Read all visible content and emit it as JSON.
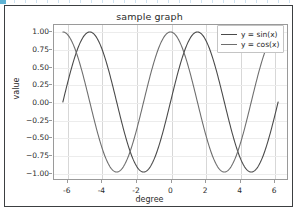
{
  "figure": {
    "background": "#ffffff",
    "border_color": "#3c3f41"
  },
  "chart_data": {
    "type": "line",
    "title": "sample graph",
    "xlabel": "degree",
    "ylabel": "value",
    "xlim": [
      -6.8,
      6.8
    ],
    "ylim": [
      -1.1,
      1.1
    ],
    "xticks": [
      "-6",
      "-4",
      "-2",
      "0",
      "2",
      "4",
      "6"
    ],
    "xtick_values": [
      -6,
      -4,
      -2,
      0,
      2,
      4,
      6
    ],
    "yticks": [
      "1.00",
      "0.75",
      "0.50",
      "0.25",
      "0.00",
      "−0.25",
      "−0.50",
      "−0.75",
      "−1.00"
    ],
    "ytick_values": [
      1.0,
      0.75,
      0.5,
      0.25,
      0.0,
      -0.25,
      -0.5,
      -0.75,
      -1.0
    ],
    "grid": true,
    "legend_position": "upper right",
    "series": [
      {
        "name": "y = sin(x)",
        "color": "#4a4a4a",
        "x": [
          -6.2832,
          -6.0,
          -5.75,
          -5.5,
          -5.25,
          -5.0,
          -4.75,
          -4.5,
          -4.25,
          -4.0,
          -3.75,
          -3.5,
          -3.25,
          -3.0,
          -2.75,
          -2.5,
          -2.25,
          -2.0,
          -1.75,
          -1.5708,
          -1.25,
          -1.0,
          -0.75,
          -0.5,
          -0.25,
          0.0,
          0.25,
          0.5,
          0.75,
          1.0,
          1.25,
          1.5708,
          1.75,
          2.0,
          2.25,
          2.5,
          2.75,
          3.0,
          3.25,
          3.5,
          3.75,
          4.0,
          4.25,
          4.5,
          4.7124,
          5.0,
          5.25,
          5.5,
          5.75,
          6.0,
          6.2832
        ],
        "y": [
          0.0,
          0.2794,
          0.5033,
          0.7055,
          0.8627,
          0.9589,
          0.9993,
          0.9775,
          0.895,
          0.7568,
          0.5716,
          0.3508,
          0.1082,
          -0.1411,
          -0.3817,
          -0.5985,
          -0.7781,
          -0.9093,
          -0.9839,
          -1.0,
          -0.949,
          -0.8415,
          -0.6816,
          -0.4794,
          -0.2474,
          0.0,
          0.2474,
          0.4794,
          0.6816,
          0.8415,
          0.949,
          1.0,
          0.9839,
          0.9093,
          0.7781,
          0.5985,
          0.3817,
          0.1411,
          -0.1082,
          -0.3508,
          -0.5716,
          -0.7568,
          -0.895,
          -0.9775,
          -1.0,
          -0.9589,
          -0.8627,
          -0.7055,
          -0.5033,
          -0.2794,
          0.0
        ]
      },
      {
        "name": "y = cos(x)",
        "color": "#6e6e6e",
        "x": [
          -6.2832,
          -6.0,
          -5.75,
          -5.5,
          -5.25,
          -5.0,
          -4.75,
          -4.5,
          -4.25,
          -4.0,
          -3.75,
          -3.5,
          -3.1416,
          -2.75,
          -2.5,
          -2.25,
          -2.0,
          -1.75,
          -1.5,
          -1.25,
          -1.0,
          -0.75,
          -0.5,
          -0.25,
          0.0,
          0.25,
          0.5,
          0.75,
          1.0,
          1.25,
          1.5,
          1.75,
          2.0,
          2.25,
          2.5,
          2.75,
          3.1416,
          3.5,
          3.75,
          4.0,
          4.25,
          4.5,
          4.75,
          5.0,
          5.25,
          5.5,
          5.75,
          6.0,
          6.2832
        ],
        "y": [
          1.0,
          0.9602,
          0.8641,
          0.7087,
          0.5058,
          0.2837,
          0.0376,
          -0.2108,
          -0.4461,
          -0.6536,
          -0.8206,
          -0.9365,
          -1.0,
          -0.9243,
          -0.8011,
          -0.6282,
          -0.4161,
          -0.1782,
          0.0707,
          0.3153,
          0.5403,
          0.7317,
          0.8776,
          0.9689,
          1.0,
          0.9689,
          0.8776,
          0.7317,
          0.5403,
          0.3153,
          0.0707,
          -0.1782,
          -0.4161,
          -0.6282,
          -0.8011,
          -0.9243,
          -1.0,
          -0.9365,
          -0.8206,
          -0.6536,
          -0.4461,
          -0.2108,
          0.0376,
          0.2837,
          0.5058,
          0.7087,
          0.8641,
          0.9602,
          1.0
        ]
      }
    ]
  }
}
